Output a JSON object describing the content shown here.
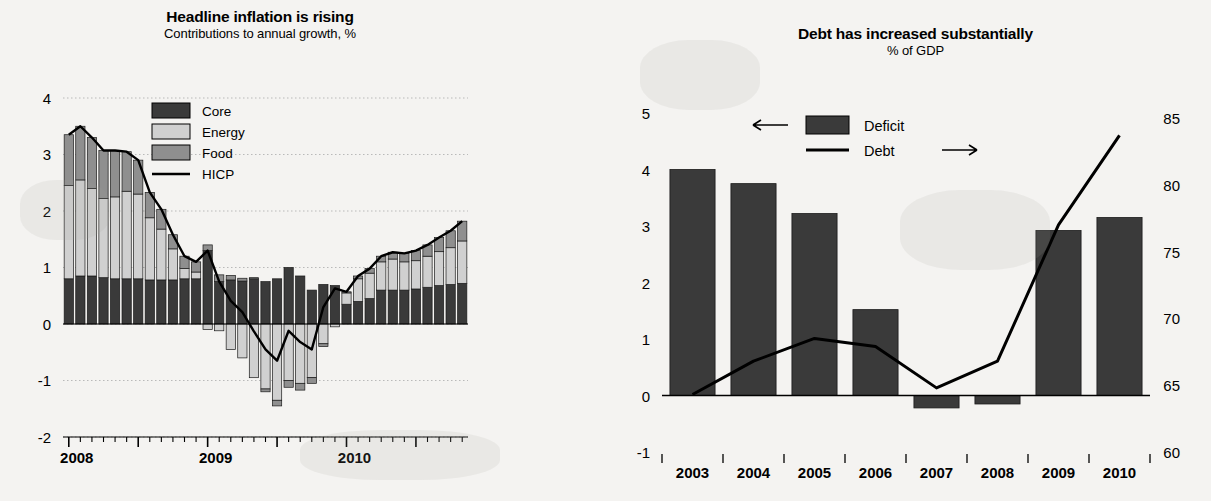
{
  "left_panel": {
    "title": "Headline inflation is rising",
    "subtitle": "Contributions to annual growth, %",
    "legend": [
      {
        "label": "Core",
        "type": "swatch",
        "color": "#3a3a3a"
      },
      {
        "label": "Energy",
        "type": "swatch",
        "color": "#d0d0d0"
      },
      {
        "label": "Food",
        "type": "swatch",
        "color": "#8f8f8f"
      },
      {
        "label": "HICP",
        "type": "line",
        "color": "#000000"
      }
    ],
    "y_ticks": [
      "4",
      "3",
      "2",
      "1",
      "0",
      "-1",
      "-2"
    ],
    "x_labels": [
      "2008",
      "2009",
      "2010"
    ]
  },
  "right_panel": {
    "title": "Debt has increased substantially",
    "subtitle": "% of GDP",
    "legend": [
      {
        "label": "Deficit",
        "type": "swatch",
        "color": "#3a3a3a",
        "arrow": "left-arrow"
      },
      {
        "label": "Debt",
        "type": "line",
        "color": "#000000",
        "arrow": "right-arrow"
      }
    ],
    "y_ticks_left": [
      "5",
      "4",
      "3",
      "2",
      "1",
      "0",
      "-1"
    ],
    "y_ticks_right": [
      "85",
      "80",
      "75",
      "70",
      "65",
      "60"
    ],
    "x_labels": [
      "2003",
      "2004",
      "2005",
      "2006",
      "2007",
      "2008",
      "2009",
      "2010"
    ]
  },
  "chart_data": [
    {
      "type": "bar",
      "id": "headline-inflation",
      "title": "Headline inflation is rising",
      "subtitle": "Contributions to annual growth, %",
      "xlabel": "",
      "ylabel": "Contributions to annual growth, %",
      "ylim": [
        -2,
        4
      ],
      "grid": true,
      "stacked": true,
      "legend_position": "top-center",
      "x": [
        "2008-01",
        "2008-02",
        "2008-03",
        "2008-04",
        "2008-05",
        "2008-06",
        "2008-07",
        "2008-08",
        "2008-09",
        "2008-10",
        "2008-11",
        "2008-12",
        "2009-01",
        "2009-02",
        "2009-03",
        "2009-04",
        "2009-05",
        "2009-06",
        "2009-07",
        "2009-08",
        "2009-09",
        "2009-10",
        "2009-11",
        "2009-12",
        "2010-01",
        "2010-02",
        "2010-03",
        "2010-04",
        "2010-05",
        "2010-06",
        "2010-07",
        "2010-08",
        "2010-09",
        "2010-10",
        "2010-11"
      ],
      "series": [
        {
          "name": "Core",
          "color": "#3a3a3a",
          "values": [
            0.8,
            0.85,
            0.85,
            0.82,
            0.8,
            0.8,
            0.8,
            0.78,
            0.78,
            0.78,
            0.8,
            0.8,
            1.3,
            0.75,
            0.78,
            0.76,
            0.8,
            0.75,
            0.8,
            1.0,
            0.85,
            0.6,
            0.7,
            0.68,
            0.35,
            0.4,
            0.45,
            0.6,
            0.6,
            0.6,
            0.62,
            0.65,
            0.68,
            0.7,
            0.72
          ]
        },
        {
          "name": "Energy",
          "color": "#d0d0d0",
          "values": [
            1.65,
            1.7,
            1.55,
            1.4,
            1.45,
            1.55,
            1.5,
            1.1,
            0.9,
            0.55,
            0.18,
            0.12,
            -0.1,
            -0.12,
            -0.45,
            -0.6,
            -0.95,
            -1.15,
            -1.35,
            -1.0,
            -1.05,
            -0.95,
            -0.35,
            -0.05,
            0.2,
            0.4,
            0.45,
            0.5,
            0.55,
            0.5,
            0.5,
            0.55,
            0.6,
            0.65,
            0.75
          ]
        },
        {
          "name": "Food",
          "color": "#8f8f8f",
          "values": [
            0.9,
            0.95,
            0.9,
            0.85,
            0.82,
            0.7,
            0.6,
            0.45,
            0.35,
            0.25,
            0.22,
            0.18,
            0.1,
            0.12,
            0.08,
            0.05,
            0.02,
            -0.05,
            -0.1,
            -0.12,
            -0.12,
            -0.1,
            -0.05,
            0.0,
            0.02,
            0.05,
            0.08,
            0.1,
            0.12,
            0.15,
            0.18,
            0.2,
            0.25,
            0.3,
            0.35
          ]
        }
      ],
      "line_series": {
        "name": "HICP",
        "color": "#000000",
        "values": [
          3.35,
          3.5,
          3.3,
          3.07,
          3.07,
          3.05,
          2.9,
          2.33,
          2.03,
          1.58,
          1.2,
          1.1,
          1.3,
          0.75,
          0.41,
          0.21,
          -0.13,
          -0.45,
          -0.65,
          -0.12,
          -0.32,
          -0.45,
          0.3,
          0.63,
          0.57,
          0.85,
          0.98,
          1.2,
          1.27,
          1.25,
          1.3,
          1.4,
          1.53,
          1.65,
          1.82
        ]
      }
    },
    {
      "type": "bar",
      "id": "debt-deficit",
      "title": "Debt has increased substantially",
      "subtitle": "% of GDP",
      "xlabel": "",
      "ylabel": "% of GDP",
      "grid": false,
      "legend_position": "top-center",
      "categories": [
        "2003",
        "2004",
        "2005",
        "2006",
        "2007",
        "2008",
        "2009",
        "2010"
      ],
      "series": [
        {
          "name": "Deficit",
          "axis": "left",
          "color": "#3a3a3a",
          "ylim": [
            -1,
            5
          ],
          "values": [
            4.0,
            3.75,
            3.22,
            1.52,
            -0.22,
            -0.15,
            2.92,
            3.15
          ]
        }
      ],
      "line_series": {
        "name": "Debt",
        "axis": "right",
        "color": "#000000",
        "ylim": [
          60,
          85
        ],
        "values": [
          64.3,
          66.8,
          68.5,
          67.9,
          64.8,
          66.8,
          77.0,
          83.7
        ]
      }
    }
  ]
}
